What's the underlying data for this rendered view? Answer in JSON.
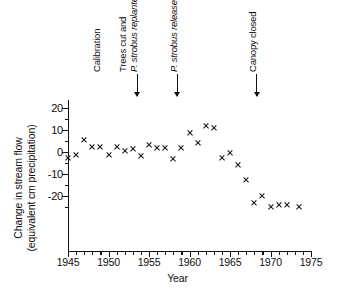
{
  "chart_data": {
    "type": "scatter",
    "title": "",
    "xlabel": "Year",
    "ylabel": "Change in stream flow (equivalent cm precipitation)",
    "ylabel_lines": [
      "Change in stream flow",
      "(equivalent cm precipitation)"
    ],
    "xlim": [
      1945,
      1975
    ],
    "ylim": [
      -28,
      25
    ],
    "grid": false,
    "legend": null,
    "marker": "x",
    "marker_color": "#111111",
    "xticks": [
      1945,
      1950,
      1955,
      1960,
      1965,
      1970,
      1975
    ],
    "xtick_labels": [
      "1945",
      "1950",
      "1955",
      "1960",
      "1965",
      "1970",
      "1975"
    ],
    "xtick_minor_step": 1,
    "yticks": [
      20,
      10,
      0,
      -10,
      -20
    ],
    "ytick_labels": [
      "20",
      "10",
      "0",
      "-10",
      "-20"
    ],
    "ytick_minor_step": 5,
    "x": [
      1945.0,
      1946.0,
      1947.0,
      1948.0,
      1949.0,
      1950.0,
      1951.0,
      1952.0,
      1953.0,
      1954.0,
      1955.0,
      1956.0,
      1957.0,
      1958.0,
      1959.0,
      1960.0,
      1961.0,
      1962.0,
      1963.0,
      1964.0,
      1965.0,
      1966.0,
      1967.0,
      1968.0,
      1969.0,
      1970.0,
      1971.0,
      1972.0,
      1973.5
    ],
    "y": [
      -2.5,
      -1.5,
      5.5,
      2.5,
      2.5,
      -1.5,
      2.5,
      0.5,
      1.5,
      -2.0,
      3.0,
      2.0,
      2.0,
      -3.0,
      2.0,
      8.5,
      4.0,
      12.0,
      11.0,
      -2.5,
      -0.5,
      -6.0,
      -12.5,
      -23.0,
      -20.0,
      -25.0,
      -24.0,
      -24.0,
      -25.0
    ],
    "points": [
      {
        "year": 1945.0,
        "value": -2.5
      },
      {
        "year": 1946.0,
        "value": -1.5
      },
      {
        "year": 1947.0,
        "value": 5.5
      },
      {
        "year": 1948.0,
        "value": 2.5
      },
      {
        "year": 1949.0,
        "value": 2.5
      },
      {
        "year": 1950.0,
        "value": -1.5
      },
      {
        "year": 1951.0,
        "value": 2.5
      },
      {
        "year": 1952.0,
        "value": 0.5
      },
      {
        "year": 1953.0,
        "value": 1.5
      },
      {
        "year": 1954.0,
        "value": -2.0
      },
      {
        "year": 1955.0,
        "value": 3.0
      },
      {
        "year": 1956.0,
        "value": 2.0
      },
      {
        "year": 1957.0,
        "value": 2.0
      },
      {
        "year": 1958.0,
        "value": -3.0
      },
      {
        "year": 1959.0,
        "value": 2.0
      },
      {
        "year": 1960.0,
        "value": 8.5
      },
      {
        "year": 1961.0,
        "value": 4.0
      },
      {
        "year": 1962.0,
        "value": 12.0
      },
      {
        "year": 1963.0,
        "value": 11.0
      },
      {
        "year": 1964.0,
        "value": -2.5
      },
      {
        "year": 1965.0,
        "value": -0.5
      },
      {
        "year": 1966.0,
        "value": -6.0
      },
      {
        "year": 1967.0,
        "value": -12.5
      },
      {
        "year": 1968.0,
        "value": -23.0
      },
      {
        "year": 1969.0,
        "value": -20.0
      },
      {
        "year": 1970.0,
        "value": -25.0
      },
      {
        "year": 1971.0,
        "value": -24.0
      },
      {
        "year": 1972.0,
        "value": -24.0
      },
      {
        "year": 1973.5,
        "value": -25.0
      }
    ],
    "annotations": [
      {
        "id": "calibration",
        "lines": [
          {
            "text": "Calibration",
            "italic": false
          }
        ],
        "year": 1949.0,
        "arrow": false
      },
      {
        "id": "trees-cut",
        "lines": [
          {
            "text": "Trees cut and",
            "italic": false
          },
          {
            "text": "P. strobus replanted",
            "italic": true
          }
        ],
        "year": 1953.5,
        "arrow": true
      },
      {
        "id": "strobus-released",
        "lines": [
          {
            "text": "P. strobus released",
            "italic": true
          }
        ],
        "year": 1958.4,
        "arrow": true
      },
      {
        "id": "canopy-closed",
        "lines": [
          {
            "text": "Canopy closed",
            "italic": false
          }
        ],
        "year": 1968.2,
        "arrow": true
      }
    ]
  },
  "caption": ""
}
